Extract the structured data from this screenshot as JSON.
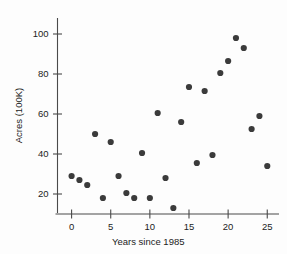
{
  "chart_data": {
    "type": "scatter",
    "title": "",
    "xlabel": "Years since 1985",
    "ylabel": "Acres (100K)",
    "xlim": [
      -1.8,
      26.5
    ],
    "ylim": [
      10,
      106
    ],
    "xticks": [
      0,
      5,
      10,
      15,
      20,
      25
    ],
    "yticks": [
      20,
      40,
      60,
      80,
      100
    ],
    "xtick_labels": [
      "0",
      "5",
      "10",
      "15",
      "20",
      "25"
    ],
    "ytick_labels": [
      "20",
      "40",
      "60",
      "80",
      "100"
    ],
    "grid": false,
    "legend": false,
    "marker_color": "#3b3b3b",
    "axis_color": "#4a4a4a",
    "background": "#fdfdfd",
    "x": [
      0,
      1,
      2,
      3,
      4,
      5,
      6,
      7,
      8,
      9,
      10,
      11,
      12,
      13,
      14,
      15,
      16,
      17,
      18,
      19,
      20,
      21,
      22,
      23,
      24,
      25
    ],
    "y": [
      29,
      27,
      24.5,
      50,
      18,
      46,
      29,
      20.5,
      18,
      40.5,
      18,
      60.5,
      28,
      13,
      56,
      73.5,
      35.5,
      71.5,
      39.5,
      80.5,
      86.5,
      98,
      93,
      52.5,
      59,
      34
    ],
    "points": [
      {
        "x": 0,
        "y": 29
      },
      {
        "x": 1,
        "y": 27
      },
      {
        "x": 2,
        "y": 24.5
      },
      {
        "x": 3,
        "y": 50
      },
      {
        "x": 4,
        "y": 18
      },
      {
        "x": 5,
        "y": 46
      },
      {
        "x": 6,
        "y": 29
      },
      {
        "x": 7,
        "y": 20.5
      },
      {
        "x": 8,
        "y": 18
      },
      {
        "x": 9,
        "y": 40.5
      },
      {
        "x": 10,
        "y": 18
      },
      {
        "x": 11,
        "y": 60.5
      },
      {
        "x": 12,
        "y": 28
      },
      {
        "x": 13,
        "y": 13
      },
      {
        "x": 14,
        "y": 56
      },
      {
        "x": 15,
        "y": 73.5
      },
      {
        "x": 16,
        "y": 35.5
      },
      {
        "x": 17,
        "y": 71.5
      },
      {
        "x": 18,
        "y": 39.5
      },
      {
        "x": 19,
        "y": 80.5
      },
      {
        "x": 20,
        "y": 86.5
      },
      {
        "x": 21,
        "y": 98
      },
      {
        "x": 22,
        "y": 93
      },
      {
        "x": 23,
        "y": 52.5
      },
      {
        "x": 24,
        "y": 59
      },
      {
        "x": 25,
        "y": 34
      }
    ]
  }
}
